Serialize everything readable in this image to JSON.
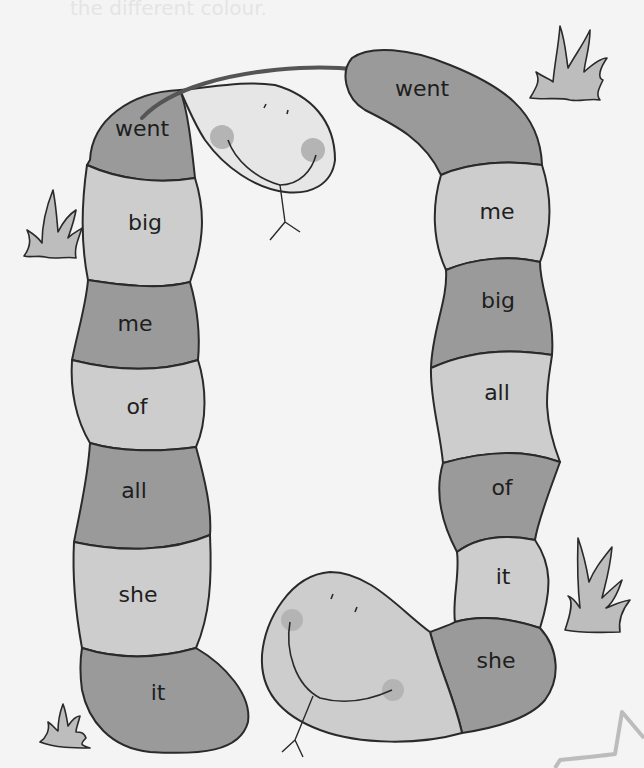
{
  "worksheet": {
    "title_ghost": "the different colour.",
    "colors": {
      "background": "#f4f4f4",
      "dark_segment": "#9a9a9a",
      "light_segment": "#cdcdcd",
      "head": "#e6e6e6",
      "outline": "#2a2a2a",
      "tongue_line": "#555555",
      "cheek": "#b4b4b4",
      "grass": "#bdbdbd",
      "star_outline": "#bcbcbc"
    },
    "left_snake": {
      "segments": [
        {
          "word": "went",
          "shade": "dark"
        },
        {
          "word": "big",
          "shade": "light"
        },
        {
          "word": "me",
          "shade": "dark"
        },
        {
          "word": "of",
          "shade": "light"
        },
        {
          "word": "all",
          "shade": "dark"
        },
        {
          "word": "she",
          "shade": "light"
        },
        {
          "word": "it",
          "shade": "dark"
        }
      ]
    },
    "right_snake": {
      "segments": [
        {
          "word": "went",
          "shade": "dark"
        },
        {
          "word": "me",
          "shade": "light"
        },
        {
          "word": "big",
          "shade": "dark"
        },
        {
          "word": "all",
          "shade": "light"
        },
        {
          "word": "of",
          "shade": "dark"
        },
        {
          "word": "it",
          "shade": "light"
        },
        {
          "word": "she",
          "shade": "dark"
        }
      ]
    },
    "decorations": [
      "grass-top-right",
      "grass-left",
      "grass-bottom-left",
      "grass-bottom-right",
      "star-bottom-right"
    ]
  }
}
